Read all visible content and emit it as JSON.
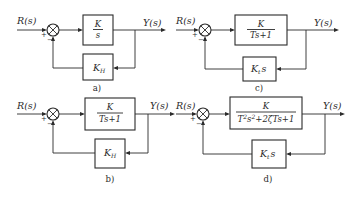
{
  "diagram": {
    "type": "control-system-block-diagrams",
    "panels": [
      {
        "id": "a",
        "caption": "a)",
        "input": "R(s)",
        "output": "Y(s)",
        "sum_signs": {
          "input": "+",
          "feedback": "−"
        },
        "forward": {
          "num": "K",
          "den": "s"
        },
        "feedback": {
          "label": "K",
          "sub": "H"
        }
      },
      {
        "id": "b",
        "caption": "b)",
        "input": "R(s)",
        "output": "Y(s)",
        "sum_signs": {
          "input": "+",
          "feedback": "−"
        },
        "forward": {
          "num": "K",
          "den": "Ts+1"
        },
        "feedback": {
          "label": "K",
          "sub": "H"
        }
      },
      {
        "id": "c",
        "caption": "c)",
        "input": "R(s)",
        "output": "Y(s)",
        "sum_signs": {
          "input": "+",
          "feedback": "−"
        },
        "forward": {
          "num": "K",
          "den": "Ts+1"
        },
        "feedback": {
          "label": "K",
          "sub": "t",
          "suffix": "s"
        }
      },
      {
        "id": "d",
        "caption": "d)",
        "input": "R(s)",
        "output": "Y(s)",
        "sum_signs": {
          "input": "+",
          "feedback": "−"
        },
        "forward": {
          "num": "K",
          "den_a": "T",
          "den_a_sup": "2",
          "den_b": "s",
          "den_b_sup": "2",
          "den_c": "+2ζTs+1"
        },
        "feedback": {
          "label": "K",
          "sub": "t",
          "suffix": "s"
        }
      }
    ]
  }
}
